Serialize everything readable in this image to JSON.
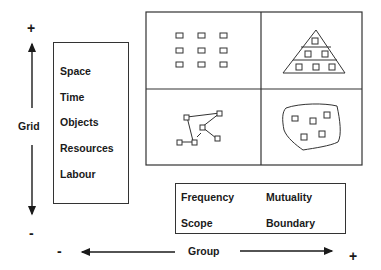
{
  "diagram": {
    "vertical_axis": {
      "label": "Grid",
      "plus": "+",
      "minus": "-"
    },
    "horizontal_axis": {
      "label": "Group",
      "plus": "+",
      "minus": "-"
    },
    "grid_dimensions": {
      "items": [
        "Space",
        "Time",
        "Objects",
        "Resources",
        "Labour"
      ]
    },
    "group_dimensions": {
      "items": [
        {
          "label": "Frequency"
        },
        {
          "label": "Mutuality"
        },
        {
          "label": "Scope"
        },
        {
          "label": "Boundary"
        }
      ]
    },
    "quadrants": [
      {
        "position": "top-left",
        "icon": "isolated-grid-icon",
        "description": "3x3 array of separate squares"
      },
      {
        "position": "top-right",
        "icon": "hierarchy-pyramid-icon",
        "description": "triangle with squares in tiers 1-2-3"
      },
      {
        "position": "bottom-left",
        "icon": "network-icon",
        "description": "squares connected by lines"
      },
      {
        "position": "bottom-right",
        "icon": "bounded-group-icon",
        "description": "squares inside irregular boundary"
      }
    ]
  }
}
